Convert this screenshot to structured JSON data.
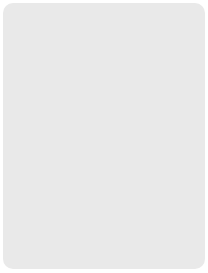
{
  "colors": {
    "background": "#e9e9e9",
    "board": "#ffffff",
    "line": "#777777",
    "black_piece": "#111111",
    "red_piece": "#8c8c8c"
  },
  "top_labels": [
    "1",
    "2",
    "3",
    "4",
    "5",
    "6",
    "7",
    "8",
    "9"
  ],
  "bottom_labels": [
    "九",
    "八",
    "七",
    "六",
    "五",
    "四",
    "三",
    "二",
    "一"
  ],
  "pieces": [
    {
      "char": "将",
      "side": "black",
      "col": 6,
      "row": 0
    },
    {
      "char": "象",
      "side": "black",
      "col": 7,
      "row": 0
    },
    {
      "char": "士",
      "side": "black",
      "col": 5,
      "row": 1
    },
    {
      "char": "兵",
      "side": "red",
      "col": 6,
      "row": 2
    },
    {
      "char": "象",
      "side": "black",
      "col": 9,
      "row": 2
    },
    {
      "char": "马",
      "side": "red",
      "col": 1,
      "row": 3
    },
    {
      "char": "车",
      "side": "red",
      "col": 2,
      "row": 5
    },
    {
      "char": "炮",
      "side": "red",
      "col": 2,
      "row": 7
    },
    {
      "char": "马",
      "side": "black",
      "col": 8,
      "row": 7
    },
    {
      "char": "卒",
      "side": "black",
      "col": 7,
      "row": 8
    },
    {
      "char": "车",
      "side": "black",
      "col": 2,
      "row": 9
    },
    {
      "char": "炮",
      "side": "black",
      "col": 5,
      "row": 9
    },
    {
      "char": "帅",
      "side": "red",
      "col": 6,
      "row": 9
    }
  ]
}
